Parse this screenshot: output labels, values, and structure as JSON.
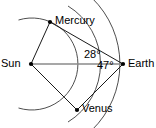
{
  "diagram": {
    "background_color": "#ffffff",
    "line_color": "#1a1a1a",
    "baseline_color": "#8a8a8a",
    "arc_color": "#3a3a3a",
    "bodies": [
      {
        "id": "sun",
        "label": "Sun",
        "x": 31,
        "y": 64,
        "has_dot": true
      },
      {
        "id": "mercury",
        "label": "Mercury",
        "x": 50,
        "y": 22,
        "has_dot": true
      },
      {
        "id": "venus",
        "label": "Venus",
        "x": 77,
        "y": 110,
        "has_dot": true
      },
      {
        "id": "earth",
        "label": "Earth",
        "x": 123,
        "y": 64,
        "has_dot": true
      }
    ],
    "angles": [
      {
        "id": "mercury-elongation",
        "value": "28",
        "unit": "°",
        "text": "28°",
        "vertex": "earth"
      },
      {
        "id": "venus-elongation",
        "value": "47",
        "unit": "°",
        "text": "47°",
        "vertex": "earth"
      }
    ],
    "segments": [
      {
        "id": "sun-earth",
        "from": "sun",
        "to": "earth",
        "style": "baseline"
      },
      {
        "id": "sun-mercury",
        "from": "sun",
        "to": "mercury",
        "style": "ray"
      },
      {
        "id": "sun-venus",
        "from": "sun",
        "to": "venus",
        "style": "ray"
      },
      {
        "id": "earth-mercury",
        "from": "earth",
        "to": "mercury",
        "style": "ray"
      },
      {
        "id": "earth-venus",
        "from": "earth",
        "to": "venus",
        "style": "ray"
      }
    ],
    "arcs": [
      {
        "id": "mercury-orbit-arc",
        "radius": 46
      },
      {
        "id": "venus-orbit-arc",
        "radius": 68
      },
      {
        "id": "earth-orbit-arc",
        "radius": 92
      }
    ]
  }
}
